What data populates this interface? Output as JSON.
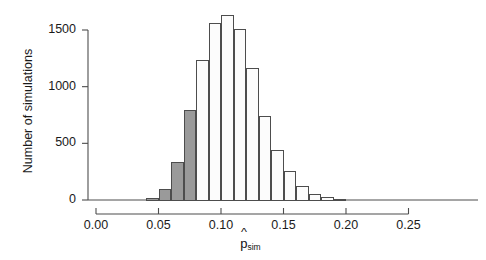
{
  "chart_data": {
    "type": "bar",
    "title": "",
    "subtitle": "",
    "xlabel": "p̂_sim",
    "xlabel_base": "p",
    "xlabel_sub": "sim",
    "ylabel": "Number of simulations",
    "xlim": [
      -0.005,
      0.265
    ],
    "ylim": [
      0,
      1700
    ],
    "grid": false,
    "legend": null,
    "bin_width": 0.01,
    "xticks": [
      0.0,
      0.05,
      0.1,
      0.15,
      0.2,
      0.25
    ],
    "xtick_labels": [
      "0.00",
      "0.05",
      "0.10",
      "0.15",
      "0.20",
      "0.25"
    ],
    "yticks": [
      0,
      500,
      1000,
      1500
    ],
    "ytick_labels": [
      "0",
      "500",
      "1000",
      "1500"
    ],
    "colors": {
      "shaded_fill": "#9a9a9a",
      "open_fill": "#fcfcfc",
      "bar_edge": "#4d4d4d",
      "axis": "#4d4d4d",
      "text": "#1a1a1a"
    },
    "bins": [
      {
        "x0": 0.0,
        "x1": 0.01,
        "center": 0.005,
        "value": 15,
        "shaded": true
      },
      {
        "x0": 0.01,
        "x1": 0.02,
        "center": 0.015,
        "value": 90,
        "shaded": true
      },
      {
        "x0": 0.02,
        "x1": 0.03,
        "center": 0.025,
        "value": 335,
        "shaded": true
      },
      {
        "x0": 0.03,
        "x1": 0.04,
        "center": 0.035,
        "value": 790,
        "shaded": true
      },
      {
        "x0": 0.04,
        "x1": 0.05,
        "center": 0.045,
        "value": 1235,
        "shaded": false
      },
      {
        "x0": 0.05,
        "x1": 0.06,
        "center": 0.055,
        "value": 1560,
        "shaded": false
      },
      {
        "x0": 0.06,
        "x1": 0.07,
        "center": 0.065,
        "value": 1625,
        "shaded": false
      },
      {
        "x0": 0.07,
        "x1": 0.08,
        "center": 0.075,
        "value": 1505,
        "shaded": false
      },
      {
        "x0": 0.08,
        "x1": 0.09,
        "center": 0.085,
        "value": 1160,
        "shaded": false
      },
      {
        "x0": 0.09,
        "x1": 0.1,
        "center": 0.095,
        "value": 735,
        "shaded": false
      },
      {
        "x0": 0.1,
        "x1": 0.11,
        "center": 0.105,
        "value": 435,
        "shaded": false
      },
      {
        "x0": 0.11,
        "x1": 0.12,
        "center": 0.115,
        "value": 250,
        "shaded": false
      },
      {
        "x0": 0.12,
        "x1": 0.13,
        "center": 0.125,
        "value": 115,
        "shaded": false
      },
      {
        "x0": 0.13,
        "x1": 0.14,
        "center": 0.135,
        "value": 50,
        "shaded": false
      },
      {
        "x0": 0.14,
        "x1": 0.15,
        "center": 0.145,
        "value": 18,
        "shaded": false
      },
      {
        "x0": 0.15,
        "x1": 0.16,
        "center": 0.155,
        "value": 6,
        "shaded": false
      }
    ],
    "bar_index_offset": 4,
    "shaded_region_note": "Bars at or below 0.05 are shaded"
  }
}
